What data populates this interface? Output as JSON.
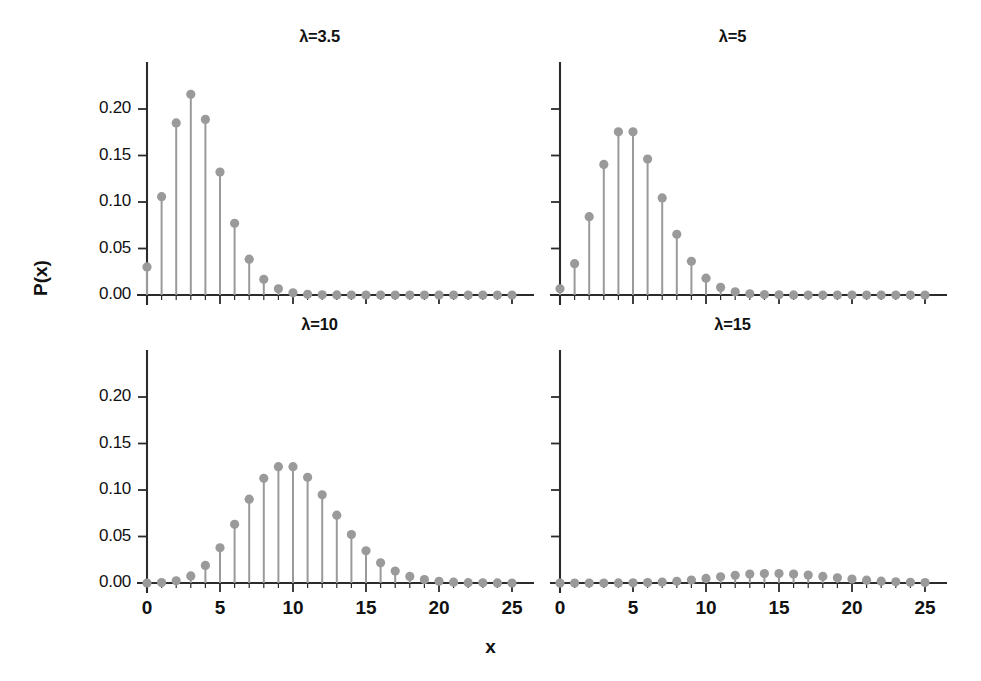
{
  "figure": {
    "width": 981,
    "height": 681,
    "background": "#ffffff",
    "axis_color": "#2b2b2b",
    "marker_color": "#9a9a9a",
    "stem_color": "#9a9a9a",
    "xlabel": "x",
    "ylabel": "P(x)"
  },
  "chart_data": {
    "type": "scatter",
    "plot_style": "stem",
    "title": "",
    "xlabel": "x",
    "ylabel": "P(x)",
    "grid": false,
    "legend": "none",
    "xlim": [
      0,
      25
    ],
    "ylim": [
      0.0,
      0.22
    ],
    "xticks": [
      0,
      5,
      10,
      15,
      20,
      25
    ],
    "xtick_labels": [
      "0",
      "5",
      "10",
      "15",
      "20",
      "25"
    ],
    "yticks": [
      0.0,
      0.05,
      0.1,
      0.15,
      0.2
    ],
    "ytick_labels": [
      "0.00",
      "0.05",
      "0.10",
      "0.15",
      "0.20"
    ],
    "x": [
      0,
      1,
      2,
      3,
      4,
      5,
      6,
      7,
      8,
      9,
      10,
      11,
      12,
      13,
      14,
      15,
      16,
      17,
      18,
      19,
      20,
      21,
      22,
      23,
      24,
      25
    ],
    "panels": [
      {
        "id": "lambda-3-5",
        "title": "λ=3.5",
        "lambda": 3.5,
        "row": 0,
        "col": 0,
        "show_ytick_labels": true,
        "show_xtick_labels": false,
        "values": [
          0.0302,
          0.1057,
          0.185,
          0.2158,
          0.1888,
          0.1322,
          0.0771,
          0.0385,
          0.0169,
          0.0066,
          0.0023,
          0.0007,
          0.0002,
          0.0001,
          0.0,
          0.0,
          0.0,
          0.0,
          0.0,
          0.0,
          0.0,
          0.0,
          0.0,
          0.0,
          0.0,
          0.0
        ]
      },
      {
        "id": "lambda-5",
        "title": "λ=5",
        "lambda": 5,
        "row": 0,
        "col": 1,
        "show_ytick_labels": false,
        "show_xtick_labels": false,
        "values": [
          0.0067,
          0.0337,
          0.0842,
          0.1404,
          0.1755,
          0.1755,
          0.1462,
          0.1044,
          0.0653,
          0.0363,
          0.0181,
          0.0082,
          0.0034,
          0.0013,
          0.0005,
          0.0002,
          0.0001,
          0.0,
          0.0,
          0.0,
          0.0,
          0.0,
          0.0,
          0.0,
          0.0,
          0.0
        ]
      },
      {
        "id": "lambda-10",
        "title": "λ=10",
        "lambda": 10,
        "row": 1,
        "col": 0,
        "show_ytick_labels": true,
        "show_xtick_labels": true,
        "values": [
          0.0,
          0.0005,
          0.0023,
          0.0076,
          0.0189,
          0.0378,
          0.0631,
          0.0901,
          0.1126,
          0.1251,
          0.1251,
          0.1137,
          0.0948,
          0.0729,
          0.0521,
          0.0347,
          0.0217,
          0.0128,
          0.0071,
          0.0037,
          0.0019,
          0.0009,
          0.0004,
          0.0002,
          0.0001,
          0.0
        ]
      },
      {
        "id": "lambda-15",
        "title": "λ=15",
        "lambda": 15,
        "row": 1,
        "col": 1,
        "show_ytick_labels": false,
        "show_xtick_labels": true,
        "values": [
          0.0,
          0.0,
          0.0,
          0.0,
          0.0001,
          0.0002,
          0.0005,
          0.001,
          0.0019,
          0.0032,
          0.0049,
          0.0066,
          0.0083,
          0.0096,
          0.0102,
          0.0102,
          0.0096,
          0.0085,
          0.0071,
          0.0056,
          0.0042,
          0.003,
          0.002,
          0.0013,
          0.0008,
          0.0005
        ]
      }
    ],
    "panel_value_scale_note": "lambda=15 values shown are PMF x 10 for rendering reference only"
  }
}
